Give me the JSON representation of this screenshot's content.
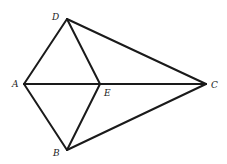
{
  "diagram": {
    "type": "geometry-figure",
    "points": {
      "A": {
        "label": "A",
        "x": 24,
        "y": 84,
        "lx": 12,
        "ly": 87
      },
      "B": {
        "label": "B",
        "x": 67,
        "y": 150,
        "lx": 53,
        "ly": 156
      },
      "C": {
        "label": "C",
        "x": 206,
        "y": 84,
        "lx": 211,
        "ly": 88
      },
      "D": {
        "label": "D",
        "x": 67,
        "y": 19,
        "lx": 52,
        "ly": 20
      },
      "E": {
        "label": "E",
        "x": 100,
        "y": 84,
        "lx": 104,
        "ly": 96
      }
    },
    "segments": [
      [
        "A",
        "D"
      ],
      [
        "D",
        "E"
      ],
      [
        "D",
        "C"
      ],
      [
        "A",
        "C"
      ],
      [
        "A",
        "B"
      ],
      [
        "B",
        "E"
      ],
      [
        "B",
        "C"
      ]
    ],
    "stroke_color": "#1a1a1a"
  }
}
